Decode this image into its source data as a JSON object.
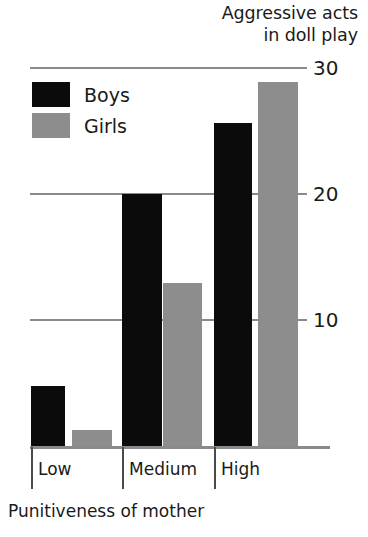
{
  "chart_data": {
    "type": "bar",
    "title": "Aggressive acts\nin doll play",
    "title_line1": "Aggressive acts",
    "title_line2": "in doll play",
    "xlabel": "Punitiveness of mother",
    "ylabel": "Aggressive acts in doll play",
    "categories": [
      "Low",
      "Medium",
      "High"
    ],
    "series": [
      {
        "name": "Boys",
        "color": "#0b0b0b",
        "values": [
          4.8,
          20.0,
          25.6
        ]
      },
      {
        "name": "Girls",
        "color": "#8d8d8d",
        "values": [
          1.3,
          12.9,
          28.9
        ]
      }
    ],
    "ylim": [
      0,
      30
    ],
    "yticks": [
      10,
      20,
      30
    ],
    "ytick_labels": [
      "10",
      "20",
      "30"
    ],
    "grid": true,
    "legend_position": "top-left"
  },
  "legend": {
    "items": [
      {
        "label": "Boys",
        "color": "#0b0b0b"
      },
      {
        "label": "Girls",
        "color": "#8d8d8d"
      }
    ]
  },
  "colors": {
    "boys": "#0b0b0b",
    "girls": "#8d8d8d",
    "gridline": "#8a8a8a",
    "text": "#1a1a1a",
    "background": "#ffffff"
  }
}
